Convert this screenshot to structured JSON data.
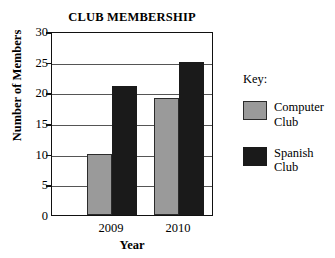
{
  "chart_data": {
    "type": "bar",
    "title": "CLUB MEMBERSHIP",
    "xlabel": "Year",
    "ylabel": "Number of Members",
    "categories": [
      "2009",
      "2010"
    ],
    "series": [
      {
        "name": "Computer Club",
        "values": [
          10,
          19
        ],
        "color": "#9a9a9a"
      },
      {
        "name": "Spanish Club",
        "values": [
          21,
          25
        ],
        "color": "#1a1a1a"
      }
    ],
    "ylim": [
      0,
      30
    ],
    "ytick_step": 5,
    "yticks": [
      0,
      5,
      10,
      15,
      20,
      25,
      30
    ],
    "ytick_labels": [
      "0",
      "5",
      "10",
      "15",
      "20",
      "25",
      "30"
    ],
    "grid": true,
    "grid_axis": "y",
    "legend_position": "right",
    "legend_title": "Key:"
  },
  "legend": {
    "title": "Key:",
    "entries": [
      {
        "label_line1": "Computer",
        "label_line2": "Club",
        "color": "#9a9a9a"
      },
      {
        "label_line1": "Spanish",
        "label_line2": "Club",
        "color": "#1a1a1a"
      }
    ]
  }
}
